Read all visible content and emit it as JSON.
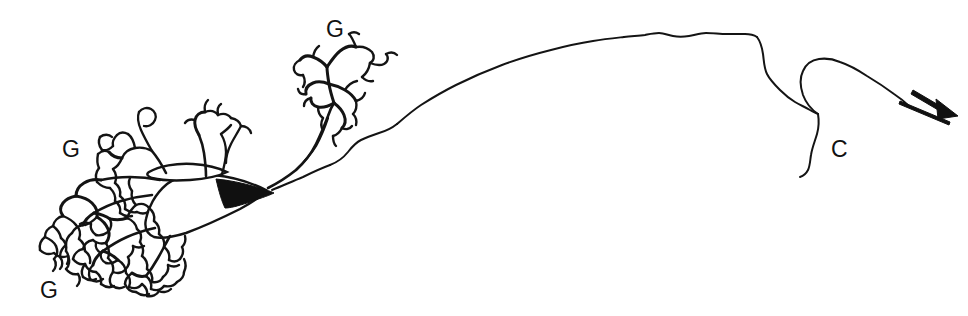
{
  "figure": {
    "kind": "camera-lucida-line-drawing",
    "background_color": "#ffffff",
    "ink_color": "#141414",
    "width": 968,
    "height": 316
  },
  "labels": [
    {
      "id": "g-top",
      "text": "G",
      "x": 326,
      "y": 18,
      "name": "label-g-dorsal-glomerulus"
    },
    {
      "id": "g-left-upper",
      "text": "G",
      "x": 62,
      "y": 138,
      "name": "label-g-upper-left-glomerulus"
    },
    {
      "id": "g-left-lower",
      "text": "G",
      "x": 40,
      "y": 279,
      "name": "label-g-lower-left-glomerulus"
    },
    {
      "id": "c-right",
      "text": "C",
      "x": 831,
      "y": 138,
      "name": "label-c-collateral"
    }
  ],
  "structures": {
    "soma": "cell body",
    "axon": "axon",
    "collateral": "axon collateral",
    "tufts": "dendritic tufts",
    "arrow": "direction arrow"
  }
}
